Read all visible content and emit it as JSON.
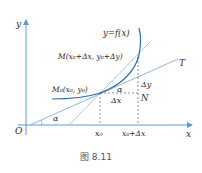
{
  "figure": {
    "caption": "图   8.11",
    "labels": {
      "y_axis": "y",
      "x_axis": "x",
      "origin": "O",
      "curve": "y=f(x)",
      "point_m": "M(x₀+Δx, y₀+Δy)",
      "point_m0": "M₀(x₀, y₀)",
      "tangent": "T",
      "delta_y": "Δy",
      "delta_x": "Δx",
      "point_n": "N",
      "alpha_top": "α",
      "alpha_bottom": "α",
      "tick_x0": "x₀",
      "tick_x0_dx": "x₀+Δx"
    },
    "colors": {
      "axis": "#5a9bd5",
      "curve": "#2e6fb5",
      "lines": "#7fb0de",
      "dashed": "#444444"
    }
  }
}
